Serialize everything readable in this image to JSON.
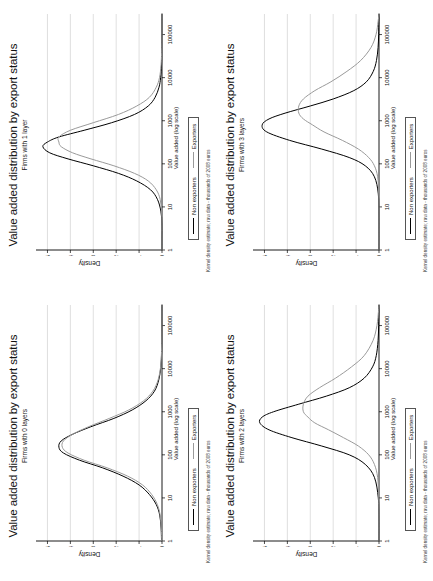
{
  "figure": {
    "background": "#ffffff",
    "panel_count": 4,
    "grid": "2x2"
  },
  "common": {
    "title": "Value added distribution by export status",
    "xlabel": "Value added (log scale)",
    "ylabel": "Density",
    "footnote": "Kernel density estimate; raw data - thousands of 2008 euros",
    "legend": {
      "nonexporters_label": "Non exporters",
      "exporters_label": "Exporters",
      "nonexporters_color": "#000000",
      "exporters_color": "#9a9a9a"
    },
    "xticks": [
      "1",
      "10",
      "100",
      "1000",
      "10000",
      "100000"
    ],
    "yticks": [
      "0",
      ".1",
      ".2",
      ".3",
      ".4",
      ".5"
    ]
  },
  "chart_data": [
    {
      "type": "line",
      "panel": "top-left",
      "title": "Value added distribution by export status",
      "subtitle": "Firms with 1 layer",
      "xlabel": "Value added (log scale)",
      "ylabel": "Density",
      "xscale": "log",
      "xlim": [
        1,
        300000
      ],
      "ylim": [
        0,
        0.55
      ],
      "xticks": [
        1,
        10,
        100,
        1000,
        10000,
        100000
      ],
      "yticks": [
        0,
        0.1,
        0.2,
        0.3,
        0.4,
        0.5
      ],
      "grid": "vertical-gridlines-on-y-ticks",
      "legend_position": "below-axis",
      "series": [
        {
          "name": "Non exporters",
          "color": "#000000",
          "x": [
            1,
            2,
            4,
            8,
            15,
            25,
            40,
            60,
            90,
            130,
            180,
            250,
            320,
            420,
            600,
            900,
            1400,
            2200,
            3500,
            6000,
            10000,
            20000,
            50000,
            150000,
            300000
          ],
          "y": [
            0.0,
            0.0,
            0.0,
            0.005,
            0.02,
            0.05,
            0.11,
            0.19,
            0.3,
            0.41,
            0.49,
            0.52,
            0.5,
            0.45,
            0.34,
            0.22,
            0.12,
            0.06,
            0.03,
            0.013,
            0.006,
            0.002,
            0.001,
            0.0,
            0.0
          ]
        },
        {
          "name": "Exporters",
          "color": "#9a9a9a",
          "x": [
            1,
            2,
            4,
            8,
            15,
            25,
            40,
            60,
            90,
            130,
            180,
            250,
            320,
            420,
            600,
            900,
            1400,
            2200,
            3500,
            6000,
            10000,
            20000,
            50000,
            150000,
            300000
          ],
          "y": [
            0.0,
            0.0,
            0.0,
            0.002,
            0.008,
            0.025,
            0.06,
            0.12,
            0.21,
            0.31,
            0.39,
            0.44,
            0.45,
            0.45,
            0.4,
            0.3,
            0.19,
            0.11,
            0.055,
            0.025,
            0.011,
            0.004,
            0.001,
            0.0,
            0.0
          ]
        }
      ]
    },
    {
      "type": "line",
      "panel": "top-right",
      "title": "Value added distribution by export status",
      "subtitle": "Firms with 3 layers",
      "xlabel": "Value added (log scale)",
      "ylabel": "Density",
      "xscale": "log",
      "xlim": [
        1,
        300000
      ],
      "ylim": [
        0,
        0.55
      ],
      "xticks": [
        1,
        10,
        100,
        1000,
        10000,
        100000
      ],
      "yticks": [
        0,
        0.1,
        0.2,
        0.3,
        0.4,
        0.5
      ],
      "grid": "vertical-gridlines-on-y-ticks",
      "legend_position": "below-axis",
      "series": [
        {
          "name": "Non exporters",
          "color": "#000000",
          "x": [
            1,
            5,
            20,
            50,
            90,
            140,
            220,
            350,
            550,
            800,
            1100,
            1500,
            2200,
            3200,
            5000,
            8000,
            14000,
            25000,
            50000,
            100000,
            200000,
            300000
          ],
          "y": [
            0.0,
            0.0,
            0.003,
            0.02,
            0.06,
            0.13,
            0.25,
            0.39,
            0.49,
            0.51,
            0.48,
            0.41,
            0.3,
            0.2,
            0.11,
            0.055,
            0.025,
            0.011,
            0.004,
            0.0015,
            0.0005,
            0.0
          ]
        },
        {
          "name": "Exporters",
          "color": "#9a9a9a",
          "x": [
            1,
            5,
            20,
            50,
            90,
            140,
            220,
            350,
            550,
            800,
            1100,
            1500,
            2200,
            3200,
            5000,
            8000,
            14000,
            25000,
            50000,
            100000,
            200000,
            300000
          ],
          "y": [
            0.0,
            0.0,
            0.001,
            0.006,
            0.02,
            0.045,
            0.09,
            0.16,
            0.24,
            0.29,
            0.33,
            0.35,
            0.35,
            0.33,
            0.28,
            0.21,
            0.14,
            0.08,
            0.035,
            0.013,
            0.004,
            0.0
          ]
        }
      ]
    },
    {
      "type": "line",
      "panel": "bottom-left",
      "title": "Value added distribution by export status",
      "subtitle": "Firms with 0 layers",
      "xlabel": "Value added (log scale)",
      "ylabel": "Density",
      "xscale": "log",
      "xlim": [
        1,
        300000
      ],
      "ylim": [
        0,
        0.55
      ],
      "xticks": [
        1,
        10,
        100,
        1000,
        10000,
        100000
      ],
      "yticks": [
        0,
        0.1,
        0.2,
        0.3,
        0.4,
        0.5
      ],
      "grid": "vertical-gridlines-on-y-ticks",
      "legend_position": "below-axis",
      "series": [
        {
          "name": "Non exporters",
          "color": "#000000",
          "x": [
            1,
            2,
            4,
            7,
            12,
            20,
            32,
            50,
            75,
            110,
            150,
            210,
            300,
            450,
            700,
            1100,
            1800,
            3000,
            5500,
            11000,
            25000,
            60000,
            150000,
            300000
          ],
          "y": [
            0.002,
            0.004,
            0.01,
            0.025,
            0.055,
            0.1,
            0.17,
            0.26,
            0.36,
            0.43,
            0.45,
            0.44,
            0.39,
            0.31,
            0.21,
            0.13,
            0.07,
            0.033,
            0.014,
            0.005,
            0.0015,
            0.0005,
            0.0,
            0.0
          ]
        },
        {
          "name": "Exporters",
          "color": "#9a9a9a",
          "x": [
            1,
            2,
            4,
            7,
            12,
            20,
            32,
            50,
            75,
            110,
            150,
            210,
            300,
            450,
            700,
            1100,
            1800,
            3000,
            5500,
            11000,
            25000,
            60000,
            150000,
            300000
          ],
          "y": [
            0.001,
            0.003,
            0.008,
            0.02,
            0.045,
            0.085,
            0.15,
            0.24,
            0.34,
            0.41,
            0.435,
            0.43,
            0.39,
            0.32,
            0.23,
            0.145,
            0.08,
            0.04,
            0.017,
            0.006,
            0.002,
            0.0006,
            0.0,
            0.0
          ]
        }
      ]
    },
    {
      "type": "line",
      "panel": "bottom-right",
      "title": "Value added distribution by export status",
      "subtitle": "Firms with 2 layers",
      "xlabel": "Value added (log scale)",
      "ylabel": "Density",
      "xscale": "log",
      "xlim": [
        1,
        300000
      ],
      "ylim": [
        0,
        0.55
      ],
      "xticks": [
        1,
        10,
        100,
        1000,
        10000,
        100000
      ],
      "yticks": [
        0,
        0.1,
        0.2,
        0.3,
        0.4,
        0.5
      ],
      "grid": "vertical-gridlines-on-y-ticks",
      "legend_position": "below-axis",
      "series": [
        {
          "name": "Non exporters",
          "color": "#000000",
          "x": [
            1,
            3,
            10,
            30,
            60,
            100,
            160,
            250,
            380,
            550,
            750,
            1000,
            1500,
            2300,
            3600,
            6000,
            11000,
            20000,
            45000,
            100000,
            220000,
            300000
          ],
          "y": [
            0.0,
            0.0,
            0.003,
            0.02,
            0.06,
            0.13,
            0.25,
            0.38,
            0.48,
            0.52,
            0.51,
            0.46,
            0.35,
            0.23,
            0.13,
            0.065,
            0.028,
            0.012,
            0.004,
            0.0015,
            0.0004,
            0.0
          ]
        },
        {
          "name": "Exporters",
          "color": "#9a9a9a",
          "x": [
            1,
            3,
            10,
            30,
            60,
            100,
            160,
            250,
            380,
            550,
            750,
            1000,
            1500,
            2300,
            3600,
            6000,
            11000,
            20000,
            45000,
            100000,
            220000,
            300000
          ],
          "y": [
            0.0,
            0.0,
            0.001,
            0.006,
            0.02,
            0.045,
            0.09,
            0.155,
            0.22,
            0.28,
            0.31,
            0.33,
            0.33,
            0.31,
            0.26,
            0.19,
            0.12,
            0.065,
            0.026,
            0.009,
            0.002,
            0.0
          ]
        }
      ]
    }
  ]
}
